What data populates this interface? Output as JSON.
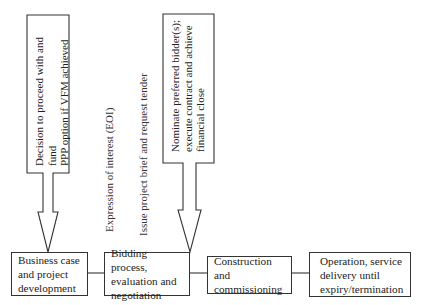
{
  "diagram": {
    "type": "process-flow",
    "stages": [
      {
        "id": "stage-1",
        "label": "Business case\nand project\ndevelopment"
      },
      {
        "id": "stage-2",
        "label": "Bidding process,\nevaluation and\nnegotiation"
      },
      {
        "id": "stage-3",
        "label": "Construction and\ncommissioning"
      },
      {
        "id": "stage-4",
        "label": "Operation, service\ndelivery until\nexpiry/termination"
      }
    ],
    "decision_arrows": [
      {
        "id": "arrow-1",
        "target": "stage-1",
        "label": "Decision to proceed with and fund\nPPP option if VFM achieved"
      },
      {
        "id": "arrow-2",
        "target": "stage-2",
        "label": "Nominate preferred bidder(s);\nexecute contract and achieve\nfinancial close"
      }
    ],
    "annotations": [
      {
        "id": "eoi",
        "label": "Expression of interest (EOI)"
      },
      {
        "id": "brief",
        "label": "Issue project brief and request tender"
      }
    ],
    "colors": {
      "stroke": "#333333",
      "text": "#222222",
      "background": "#ffffff"
    }
  }
}
